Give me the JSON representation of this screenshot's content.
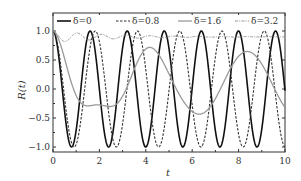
{
  "chart_data": {
    "type": "line",
    "title": "",
    "xlabel": "t",
    "ylabel": "R(t)",
    "xlim": [
      0,
      10
    ],
    "ylim": [
      -1.1,
      1.15
    ],
    "xticks": [
      "0",
      "2",
      "4",
      "6",
      "8",
      "10"
    ],
    "yticks": [
      "-1.0",
      "-0.5",
      "0.0",
      "0.5",
      "1.0"
    ],
    "legend_position": "top inside",
    "grid": false,
    "series": [
      {
        "name": "δ=0",
        "style": "solid",
        "color": "#111111",
        "function": "cos(3.93 t)"
      },
      {
        "name": "δ=0.8",
        "style": "dashed",
        "color": "#444444",
        "function": "cos(3.45 t) approx"
      },
      {
        "name": "δ=1.6",
        "style": "solid-gray",
        "color": "#999999",
        "function": "slow oscillation, minima ≈ -0.5 to -0.4"
      },
      {
        "name": "δ=3.2",
        "style": "dash-dot",
        "color": "#888888",
        "function": "≈ 0.88 to 1.0 with decaying ripple"
      }
    ]
  },
  "legend": [
    "δ=0",
    "δ=0.8",
    "δ=1.6",
    "δ=3.2"
  ]
}
